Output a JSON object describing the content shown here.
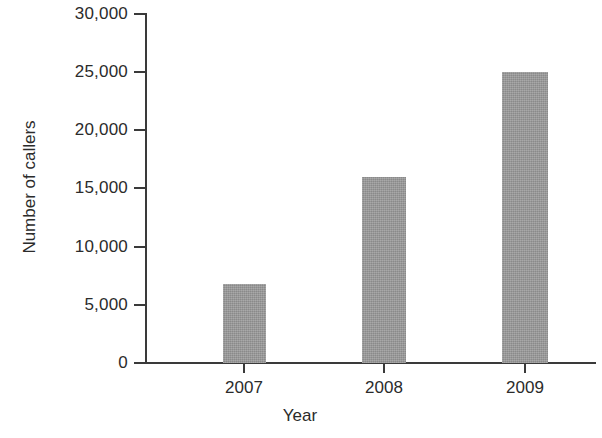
{
  "chart_data": {
    "type": "bar",
    "title": "",
    "subtitle": "",
    "xlabel": "Year",
    "ylabel": "Number of callers",
    "categories": [
      "2007",
      "2008",
      "2009"
    ],
    "values": [
      6800,
      16000,
      25000
    ],
    "series": [
      {
        "name": "Number of callers",
        "values": [
          6800,
          16000,
          25000
        ]
      }
    ],
    "ylim": [
      0,
      30000
    ],
    "ytick_values": [
      0,
      5000,
      10000,
      15000,
      20000,
      25000,
      30000
    ],
    "ytick_labels": [
      "0",
      "5,000",
      "10,000",
      "15,000",
      "20,000",
      "25,000",
      "30,000"
    ],
    "xtick_labels": [
      "2007",
      "2008",
      "2009"
    ],
    "grid": false,
    "legend": false,
    "legend_position": "none",
    "bar_color": "#969696",
    "axis_color": "#3a3a3a",
    "background_color": "#ffffff",
    "annotations": []
  }
}
